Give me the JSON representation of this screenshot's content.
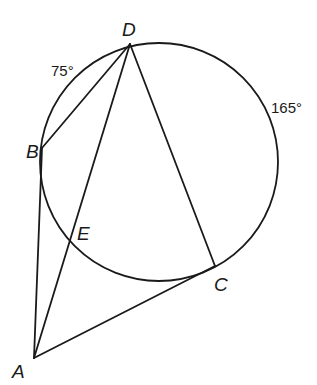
{
  "diagram": {
    "type": "circle-geometry",
    "circle": {
      "cx": 159,
      "cy": 162,
      "r": 119
    },
    "points": {
      "A": {
        "label": "A",
        "x": 34,
        "y": 358,
        "lx": 12,
        "ly": 378
      },
      "B": {
        "label": "B",
        "x": 42,
        "y": 148,
        "lx": 26,
        "ly": 157
      },
      "C": {
        "label": "C",
        "x": 215,
        "y": 266,
        "lx": 214,
        "ly": 291
      },
      "D": {
        "label": "D",
        "x": 130,
        "y": 44,
        "lx": 122,
        "ly": 36
      },
      "E": {
        "label": "E",
        "x": 71,
        "y": 239,
        "lx": 77,
        "ly": 239
      }
    },
    "segments": [
      [
        "D",
        "B"
      ],
      [
        "D",
        "A"
      ],
      [
        "D",
        "C"
      ],
      [
        "B",
        "A"
      ],
      [
        "A",
        "C"
      ]
    ],
    "arc_labels": {
      "arc_BD": "75°",
      "arc_DC": "165°"
    },
    "stroke_color": "#1a1a1a",
    "background": "#ffffff"
  }
}
